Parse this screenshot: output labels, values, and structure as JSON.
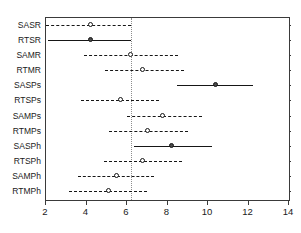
{
  "chart_data": {
    "type": "scatter",
    "title": "",
    "subtitle": "",
    "xlabel": "",
    "ylabel": "",
    "xlim": [
      2,
      14
    ],
    "ylim": [
      0,
      12
    ],
    "grid": false,
    "legend": null,
    "orientation": "horizontal",
    "reference_line": 6.2,
    "xticks": [
      2,
      4,
      6,
      8,
      10,
      12,
      14
    ],
    "xticklabels": [
      "2",
      "4",
      "6",
      "8",
      "10",
      "12",
      "14"
    ],
    "categories": [
      "SASR",
      "RTSR",
      "SAMR",
      "RTMR",
      "SASPs",
      "RTSPs",
      "SAMPs",
      "RTMPs",
      "SASPh",
      "RTSPh",
      "SAMPh",
      "RTMPh"
    ],
    "points": [
      {
        "label": "SASR",
        "value": 4.2,
        "low": 2.0,
        "high": 6.2,
        "style": "dashed",
        "marker": "open"
      },
      {
        "label": "RTSR",
        "value": 4.2,
        "low": 2.1,
        "high": 6.2,
        "style": "solid",
        "marker": "filled"
      },
      {
        "label": "SAMR",
        "value": 6.2,
        "low": 3.9,
        "high": 8.5,
        "style": "dashed",
        "marker": "open"
      },
      {
        "label": "RTMR",
        "value": 6.8,
        "low": 4.9,
        "high": 8.8,
        "style": "dashed",
        "marker": "open"
      },
      {
        "label": "SASPs",
        "value": 10.4,
        "low": 8.45,
        "high": 12.2,
        "style": "solid",
        "marker": "filled"
      },
      {
        "label": "RTSPs",
        "value": 5.7,
        "low": 3.75,
        "high": 7.6,
        "style": "dashed",
        "marker": "open"
      },
      {
        "label": "SAMPs",
        "value": 7.8,
        "low": 6.0,
        "high": 9.7,
        "style": "dashed",
        "marker": "open"
      },
      {
        "label": "RTMPs",
        "value": 7.05,
        "low": 5.1,
        "high": 9.0,
        "style": "dashed",
        "marker": "open"
      },
      {
        "label": "SASPh",
        "value": 8.2,
        "low": 6.35,
        "high": 10.2,
        "style": "solid",
        "marker": "filled"
      },
      {
        "label": "RTSPh",
        "value": 6.8,
        "low": 4.85,
        "high": 8.7,
        "style": "dashed",
        "marker": "open"
      },
      {
        "label": "SAMPh",
        "value": 5.5,
        "low": 3.6,
        "high": 7.35,
        "style": "dashed",
        "marker": "open"
      },
      {
        "label": "RTMPh",
        "value": 5.1,
        "low": 3.15,
        "high": 7.0,
        "style": "dashed",
        "marker": "open"
      }
    ],
    "colors": {
      "line": "#161616",
      "axis": "#3a3a3a",
      "reference": "#8d8d8d",
      "background": "#ffffff"
    }
  }
}
